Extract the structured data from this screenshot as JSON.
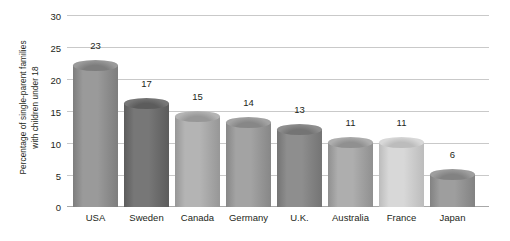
{
  "chart_data": {
    "type": "bar",
    "title": "",
    "subtitle": "",
    "xlabel": "",
    "ylabel": "Percentage of single-parent families with children under 18",
    "ylabel_lines": [
      "Percentage of single-parent families",
      "with children under 18"
    ],
    "categories": [
      "USA",
      "Sweden",
      "Canada",
      "Germany",
      "U.K.",
      "Australia",
      "France",
      "Japan"
    ],
    "values": [
      23,
      17,
      15,
      14,
      13,
      11,
      11,
      6
    ],
    "value_labels": [
      "23",
      "17",
      "15",
      "14",
      "13",
      "11",
      "11",
      "6"
    ],
    "ylim": [
      0,
      30
    ],
    "yticks": [
      0,
      5,
      10,
      15,
      20,
      25,
      30
    ],
    "ytick_labels": [
      "0",
      "5",
      "10",
      "15",
      "20",
      "25",
      "30"
    ],
    "grid": true,
    "legend": false,
    "legend_position": "none",
    "bar_style": "cylinder",
    "bar_colors": [
      "#9a9a9a",
      "#777777",
      "#b4b4b4",
      "#a3a3a3",
      "#8e8e8e",
      "#aeaeae",
      "#d8d8d8",
      "#9e9e9e"
    ],
    "bar_colors_dark": [
      "#7d7d7d",
      "#5c5c5c",
      "#979797",
      "#878787",
      "#747474",
      "#909090",
      "#bcbcbc",
      "#828282"
    ],
    "axis_color": "#c9c9c9",
    "text_color": "#231f20",
    "background": "#ffffff"
  }
}
